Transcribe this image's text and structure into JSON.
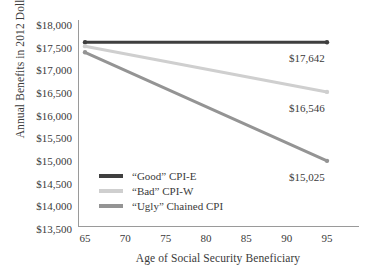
{
  "chart_data": {
    "type": "line",
    "title": "",
    "xlabel": "Age of Social Security Beneficiary",
    "ylabel": "Annual Benefits in 2012 Dollars",
    "x": [
      65,
      95
    ],
    "xlim": [
      64,
      96
    ],
    "ylim": [
      13500,
      18000
    ],
    "xticks": [
      "65",
      "70",
      "75",
      "80",
      "85",
      "90",
      "95"
    ],
    "xtick_values": [
      65,
      70,
      75,
      80,
      85,
      90,
      95
    ],
    "yticks": [
      "$18,000",
      "$17,500",
      "$17,000",
      "$16,500",
      "$16,000",
      "$15,500",
      "$15,000",
      "$14,500",
      "$14,000",
      "$13,500"
    ],
    "ytick_values": [
      18000,
      17500,
      17000,
      16500,
      16000,
      15500,
      15000,
      14500,
      14000,
      13500
    ],
    "grid": false,
    "legend_position": "center-left-inside",
    "series": [
      {
        "name": "“Good” CPI-E",
        "color": "#3f3f3f",
        "values": [
          17642,
          17642
        ],
        "end_label": "$17,642"
      },
      {
        "name": "“Bad” CPI-W",
        "color": "#cfcfcf",
        "values": [
          17555,
          16546
        ],
        "end_label": "$16,546"
      },
      {
        "name": "“Ugly” Chained CPI",
        "color": "#949494",
        "values": [
          17420,
          15025
        ],
        "end_label": "$15,025"
      }
    ],
    "axis_color": "#9a9a9a",
    "text_color": "#3a3a3a",
    "background": "#ffffff"
  }
}
